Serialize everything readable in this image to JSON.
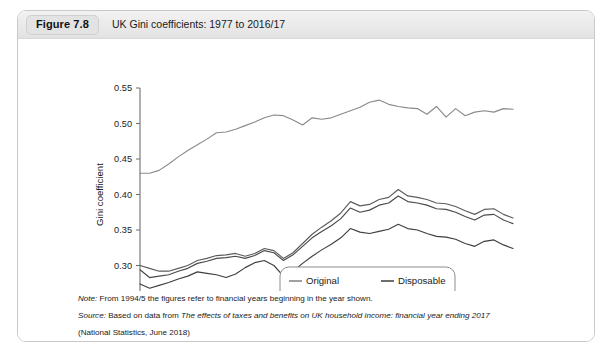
{
  "figure": {
    "badge": "Figure 7.8",
    "title": "UK Gini coefficients: 1977 to 2016/17"
  },
  "notes": {
    "note_label": "Note:",
    "note_text": " From 1994/5 the figures refer to financial years beginning in the year shown.",
    "source_label": "Source:",
    "source_text_a": " Based on data from ",
    "source_italic": "The effects of taxes and benefits on UK household income: financial year ending 2017",
    "source_text_b": "(National Statistics, June 2018)"
  },
  "chart_data": {
    "type": "line",
    "title": "UK Gini coefficients: 1977 to 2016/17",
    "xlabel": "",
    "ylabel": "Gini coefficient",
    "xlim": [
      1977,
      2016
    ],
    "ylim": [
      0.25,
      0.55
    ],
    "ytick_step": 0.05,
    "yticks": [
      "0.25",
      "0.30",
      "0.35",
      "0.40",
      "0.45",
      "0.50",
      "0.55"
    ],
    "ytick_values": [
      0.25,
      0.3,
      0.35,
      0.4,
      0.45,
      0.5,
      0.55
    ],
    "xticks_labeled": [
      "1977",
      "1982",
      "1987",
      "1992",
      "1997",
      "2002",
      "2007",
      "2012"
    ],
    "xtick_values": [
      1977,
      1982,
      1987,
      1992,
      1997,
      2002,
      2007,
      2012
    ],
    "xtick_minor_step": 1,
    "grid": false,
    "legend_position": "inside-lower-center",
    "colors": {
      "original": "#8a8a8a",
      "gross": "#5c5c5c",
      "disposable": "#4a4a4a",
      "post_tax": "#3f3f3f"
    },
    "x": [
      1977,
      1978,
      1979,
      1980,
      1981,
      1982,
      1983,
      1984,
      1985,
      1986,
      1987,
      1988,
      1989,
      1990,
      1991,
      1992,
      1993,
      1994,
      1995,
      1996,
      1997,
      1998,
      1999,
      2000,
      2001,
      2002,
      2003,
      2004,
      2005,
      2006,
      2007,
      2008,
      2009,
      2010,
      2011,
      2012,
      2013,
      2014,
      2015,
      2016
    ],
    "series": [
      {
        "name": "Original",
        "values": [
          0.43,
          0.43,
          0.434,
          0.443,
          0.453,
          0.462,
          0.47,
          0.478,
          0.487,
          0.488,
          0.492,
          0.497,
          0.502,
          0.508,
          0.512,
          0.511,
          0.505,
          0.498,
          0.508,
          0.506,
          0.508,
          0.513,
          0.518,
          0.523,
          0.53,
          0.533,
          0.527,
          0.524,
          0.522,
          0.521,
          0.513,
          0.524,
          0.509,
          0.521,
          0.511,
          0.516,
          0.518,
          0.516,
          0.521,
          0.52
        ]
      },
      {
        "name": "Gross",
        "values": [
          0.3,
          0.296,
          0.292,
          0.292,
          0.296,
          0.3,
          0.307,
          0.31,
          0.314,
          0.315,
          0.317,
          0.313,
          0.317,
          0.324,
          0.321,
          0.31,
          0.318,
          0.331,
          0.344,
          0.354,
          0.363,
          0.374,
          0.39,
          0.384,
          0.386,
          0.393,
          0.396,
          0.407,
          0.398,
          0.396,
          0.393,
          0.388,
          0.387,
          0.383,
          0.377,
          0.372,
          0.379,
          0.38,
          0.372,
          0.367
        ]
      },
      {
        "name": "Disposable",
        "values": [
          0.294,
          0.283,
          0.285,
          0.287,
          0.292,
          0.296,
          0.303,
          0.306,
          0.31,
          0.311,
          0.313,
          0.31,
          0.314,
          0.321,
          0.318,
          0.307,
          0.315,
          0.327,
          0.339,
          0.348,
          0.356,
          0.366,
          0.381,
          0.375,
          0.378,
          0.385,
          0.388,
          0.398,
          0.39,
          0.388,
          0.385,
          0.38,
          0.379,
          0.375,
          0.369,
          0.364,
          0.371,
          0.372,
          0.364,
          0.359
        ]
      },
      {
        "name": "Post Tax",
        "values": [
          0.274,
          0.268,
          0.272,
          0.276,
          0.281,
          0.285,
          0.291,
          0.289,
          0.287,
          0.283,
          0.288,
          0.297,
          0.304,
          0.307,
          0.3,
          0.285,
          0.292,
          0.303,
          0.313,
          0.322,
          0.33,
          0.339,
          0.352,
          0.347,
          0.345,
          0.348,
          0.351,
          0.358,
          0.352,
          0.35,
          0.345,
          0.341,
          0.34,
          0.337,
          0.331,
          0.327,
          0.334,
          0.336,
          0.329,
          0.324
        ]
      }
    ],
    "legend_entries": [
      {
        "label": "Original",
        "color": "#8a8a8a"
      },
      {
        "label": "Disposable",
        "color": "#4a4a4a"
      },
      {
        "label": "Gross",
        "color": "#5c5c5c"
      },
      {
        "label": "Post Tax",
        "color": "#3f3f3f"
      }
    ]
  }
}
